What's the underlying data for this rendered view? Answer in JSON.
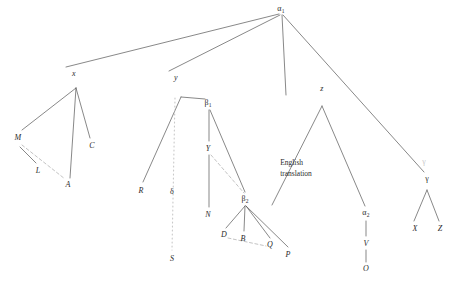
{
  "diagram": {
    "background_color": "#ffffff",
    "line_color": "#555555",
    "faint_color": "#c9c9c9",
    "text_color": "#2b2b2b",
    "width": 452,
    "height": 287,
    "annotations": [
      {
        "id": "english-translation",
        "text": "English\ntranslation",
        "x": 296,
        "y": 168
      }
    ],
    "nodes": [
      {
        "id": "alpha1",
        "label": "α1",
        "base": "α",
        "sub": "1",
        "type": "greek",
        "x": 281,
        "y": 9
      },
      {
        "id": "x",
        "label": "x",
        "type": "italic",
        "x": 74,
        "y": 73
      },
      {
        "id": "y",
        "label": "y",
        "type": "italic",
        "x": 176,
        "y": 77
      },
      {
        "id": "z",
        "label": "z",
        "type": "italic",
        "x": 322,
        "y": 88
      },
      {
        "id": "gamma",
        "label": "γ",
        "type": "greek",
        "x": 427,
        "y": 178
      },
      {
        "id": "gamma-faint",
        "label": "γ",
        "type": "greek-faint",
        "x": 424,
        "y": 161
      },
      {
        "id": "M",
        "label": "M",
        "type": "italic",
        "x": 18,
        "y": 137
      },
      {
        "id": "L",
        "label": "L",
        "type": "italic",
        "x": 38,
        "y": 170
      },
      {
        "id": "C",
        "label": "C",
        "type": "italic",
        "x": 92,
        "y": 145
      },
      {
        "id": "A",
        "label": "A",
        "type": "italic",
        "x": 68,
        "y": 184
      },
      {
        "id": "beta1",
        "label": "β1",
        "base": "β",
        "sub": "1",
        "type": "greek",
        "x": 208,
        "y": 103
      },
      {
        "id": "R",
        "label": "R",
        "type": "italic",
        "x": 141,
        "y": 190
      },
      {
        "id": "delta",
        "label": "δ",
        "type": "greek",
        "x": 172,
        "y": 191
      },
      {
        "id": "S",
        "label": "S",
        "type": "italic",
        "x": 172,
        "y": 258
      },
      {
        "id": "Y",
        "label": "Y",
        "type": "italic",
        "x": 208,
        "y": 148
      },
      {
        "id": "N",
        "label": "N",
        "type": "italic",
        "x": 208,
        "y": 214
      },
      {
        "id": "beta2",
        "label": "β2",
        "base": "β",
        "sub": "2",
        "type": "greek",
        "x": 245,
        "y": 199
      },
      {
        "id": "D",
        "label": "D",
        "type": "italic",
        "x": 224,
        "y": 234
      },
      {
        "id": "B",
        "label": "B",
        "type": "italic",
        "x": 243,
        "y": 238
      },
      {
        "id": "Q",
        "label": "Q",
        "type": "italic",
        "x": 270,
        "y": 244
      },
      {
        "id": "P",
        "label": "P",
        "type": "italic",
        "x": 288,
        "y": 254
      },
      {
        "id": "alpha2",
        "label": "α2",
        "base": "α",
        "sub": "2",
        "type": "greek",
        "x": 366,
        "y": 213
      },
      {
        "id": "V",
        "label": "V",
        "type": "italic",
        "x": 366,
        "y": 243
      },
      {
        "id": "O",
        "label": "O",
        "type": "italic",
        "x": 366,
        "y": 268
      },
      {
        "id": "X",
        "label": "X",
        "type": "italic",
        "x": 415,
        "y": 228
      },
      {
        "id": "Z",
        "label": "Z",
        "type": "italic",
        "x": 440,
        "y": 228
      }
    ],
    "edges": [
      {
        "id": "alpha1-x",
        "from": "alpha1",
        "style": "solid",
        "x1": 279,
        "y1": 14,
        "x2": 66,
        "y2": 67
      },
      {
        "id": "alpha1-y",
        "from": "alpha1",
        "style": "solid",
        "x1": 280,
        "y1": 15,
        "x2": 169,
        "y2": 71
      },
      {
        "id": "alpha1-z",
        "from": "alpha1",
        "style": "solid",
        "x1": 282,
        "y1": 15,
        "x2": 286,
        "y2": 95
      },
      {
        "id": "alpha1-gamma",
        "from": "alpha1",
        "style": "solid",
        "x1": 283,
        "y1": 15,
        "x2": 424,
        "y2": 172
      },
      {
        "id": "x-apex-M",
        "style": "solid",
        "x1": 76,
        "y1": 88,
        "x2": 22,
        "y2": 130
      },
      {
        "id": "x-apex-A",
        "style": "solid",
        "x1": 76,
        "y1": 88,
        "x2": 70,
        "y2": 178
      },
      {
        "id": "x-apex-C",
        "style": "solid",
        "x1": 76,
        "y1": 88,
        "x2": 90,
        "y2": 138
      },
      {
        "id": "M-L",
        "style": "solid",
        "x1": 20,
        "y1": 147,
        "x2": 36,
        "y2": 163
      },
      {
        "id": "M-A",
        "style": "dashed",
        "x1": 22,
        "y1": 145,
        "x2": 65,
        "y2": 179
      },
      {
        "id": "y-apex-R",
        "style": "solid",
        "x1": 181,
        "y1": 97,
        "x2": 143,
        "y2": 182
      },
      {
        "id": "y-apex-beta1",
        "style": "solid",
        "x1": 181,
        "y1": 97,
        "x2": 205,
        "y2": 99
      },
      {
        "id": "y-apex-S-dotted",
        "style": "dotted",
        "x1": 175,
        "y1": 98,
        "x2": 172,
        "y2": 250
      },
      {
        "id": "beta1-Y",
        "style": "solid",
        "x1": 209,
        "y1": 110,
        "x2": 209,
        "y2": 141
      },
      {
        "id": "beta1-beta2",
        "style": "solid",
        "x1": 210,
        "y1": 110,
        "x2": 245,
        "y2": 192
      },
      {
        "id": "Y-N",
        "style": "solid",
        "x1": 209,
        "y1": 155,
        "x2": 209,
        "y2": 207
      },
      {
        "id": "Y-beta2",
        "style": "dashed",
        "x1": 211,
        "y1": 155,
        "x2": 244,
        "y2": 193
      },
      {
        "id": "beta2-D",
        "style": "solid",
        "x1": 245,
        "y1": 206,
        "x2": 226,
        "y2": 228
      },
      {
        "id": "beta2-B",
        "style": "solid",
        "x1": 245,
        "y1": 206,
        "x2": 244,
        "y2": 231
      },
      {
        "id": "beta2-Q",
        "style": "solid",
        "x1": 246,
        "y1": 206,
        "x2": 270,
        "y2": 238
      },
      {
        "id": "beta2-P",
        "style": "solid",
        "x1": 246,
        "y1": 206,
        "x2": 288,
        "y2": 247
      },
      {
        "id": "D-Q-dashed",
        "style": "dashed",
        "x1": 228,
        "y1": 238,
        "x2": 266,
        "y2": 246
      },
      {
        "id": "z-apex-alpha2",
        "style": "solid",
        "x1": 322,
        "y1": 106,
        "x2": 365,
        "y2": 206
      },
      {
        "id": "z-apex-left",
        "style": "solid",
        "x1": 322,
        "y1": 106,
        "x2": 272,
        "y2": 205
      },
      {
        "id": "alpha2-V",
        "style": "solid",
        "x1": 366,
        "y1": 221,
        "x2": 366,
        "y2": 236
      },
      {
        "id": "V-O",
        "style": "solid",
        "x1": 366,
        "y1": 250,
        "x2": 366,
        "y2": 262
      },
      {
        "id": "gamma-X",
        "style": "solid",
        "x1": 427,
        "y1": 190,
        "x2": 414,
        "y2": 221
      },
      {
        "id": "gamma-Z",
        "style": "solid",
        "x1": 427,
        "y1": 190,
        "x2": 439,
        "y2": 221
      }
    ]
  }
}
